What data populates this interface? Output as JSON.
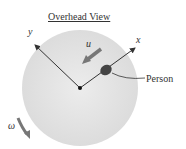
{
  "diagram": {
    "title": "Overhead View",
    "labels": {
      "y_axis": "y",
      "x_axis": "x",
      "velocity": "u",
      "angular": "ω",
      "person": "Person"
    },
    "colors": {
      "disk": "#e4e4e4",
      "arrow": "#777777",
      "axis": "#333333",
      "person": "#444444"
    }
  }
}
